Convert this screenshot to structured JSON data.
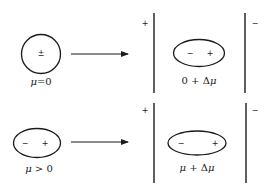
{
  "diagram": {
    "type": "dipole polarization in electric field",
    "rows": [
      {
        "initial": {
          "shape": "circle",
          "charge_symbols": [
            "±"
          ],
          "label_parts": [
            "μ",
            "=0"
          ]
        },
        "final": {
          "shape": "ellipse",
          "charge_symbols": [
            "−",
            "+"
          ],
          "label_parts": [
            "0 + Δ",
            "μ"
          ],
          "plate_left_sign": "+",
          "plate_right_sign": "−"
        }
      },
      {
        "initial": {
          "shape": "ellipse",
          "charge_symbols": [
            "−",
            "+"
          ],
          "label_parts": [
            "μ",
            " > 0"
          ]
        },
        "final": {
          "shape": "elongated-ellipse",
          "charge_symbols": [
            "−",
            "+"
          ],
          "label_parts": [
            "μ",
            " + Δ",
            "μ"
          ],
          "plate_left_sign": "+",
          "plate_right_sign": "−"
        }
      }
    ],
    "colors": {
      "stroke": "#1a1a1a",
      "background": "#ffffff"
    }
  }
}
